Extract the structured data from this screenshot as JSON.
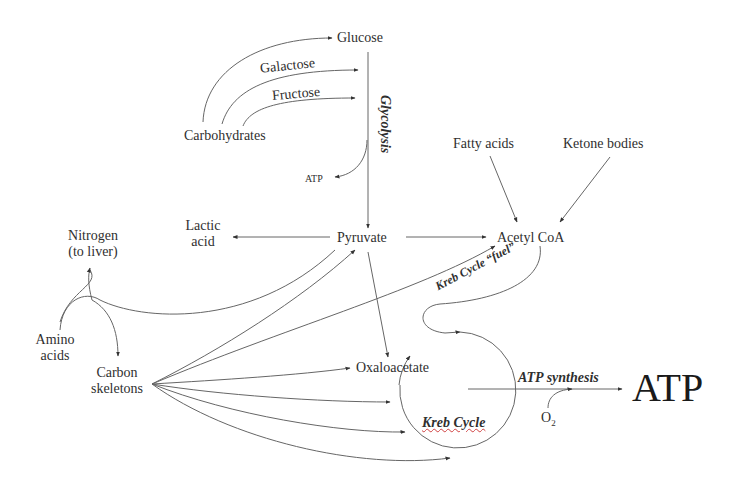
{
  "diagram": {
    "nodes": {
      "glucose": "Glucose",
      "galactose": "Galactose",
      "fructose": "Fructose",
      "carbohydrates": "Carbohydrates",
      "glycolysis": "Glycolysis",
      "atp_small": "ATP",
      "fatty_acids": "Fatty acids",
      "ketone_bodies": "Ketone bodies",
      "lactic_acid_line1": "Lactic",
      "lactic_acid_line2": "acid",
      "pyruvate": "Pyruvate",
      "acetyl_coa": "Acetyl CoA",
      "nitrogen_line1": "Nitrogen",
      "nitrogen_line2": "(to liver)",
      "amino_acids_line1": "Amino",
      "amino_acids_line2": "acids",
      "carbon_skeletons_line1": "Carbon",
      "carbon_skeletons_line2": "skeletons",
      "kreb_cycle_fuel": "Kreb Cycle “fuel”",
      "oxaloacetate": "Oxaloacetate",
      "kreb_cycle": "Kreb Cycle",
      "atp_synthesis": "ATP synthesis",
      "o2_base": "O",
      "o2_sub": "2",
      "atp_big": "ATP"
    },
    "edges": [
      {
        "from": "Carbohydrates",
        "to": "Glucose"
      },
      {
        "from": "Carbohydrates",
        "to": "Galactose"
      },
      {
        "from": "Carbohydrates",
        "to": "Fructose"
      },
      {
        "from": "Glucose",
        "to": "Pyruvate",
        "label": "Glycolysis"
      },
      {
        "from": "Glycolysis",
        "to": "ATP"
      },
      {
        "from": "Pyruvate",
        "to": "Lactic acid"
      },
      {
        "from": "Pyruvate",
        "to": "Acetyl CoA"
      },
      {
        "from": "Pyruvate",
        "to": "Oxaloacetate"
      },
      {
        "from": "Fatty acids",
        "to": "Acetyl CoA"
      },
      {
        "from": "Ketone bodies",
        "to": "Acetyl CoA"
      },
      {
        "from": "Acetyl CoA",
        "to": "Kreb Cycle",
        "label": "Kreb Cycle “fuel”"
      },
      {
        "from": "Amino acids",
        "to": "Nitrogen (to liver)"
      },
      {
        "from": "Amino acids",
        "to": "Carbon skeletons"
      },
      {
        "from": "Carbon skeletons",
        "to": "Pyruvate"
      },
      {
        "from": "Carbon skeletons",
        "to": "Acetyl CoA"
      },
      {
        "from": "Carbon skeletons",
        "to": "Oxaloacetate"
      },
      {
        "from": "Carbon skeletons",
        "to": "Kreb Cycle"
      },
      {
        "from": "Kreb Cycle",
        "to": "ATP",
        "label": "ATP synthesis"
      },
      {
        "from": "O2",
        "to": "ATP synthesis"
      }
    ],
    "colors": {
      "line": "#555555",
      "text": "#2f2f2f",
      "spellcheck_underline": "#d04040"
    }
  }
}
